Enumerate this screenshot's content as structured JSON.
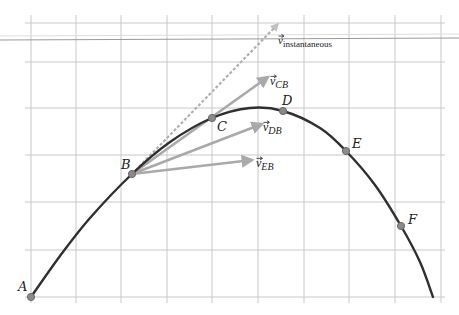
{
  "diagram": {
    "type": "projectile trajectory with average velocity vectors",
    "colors": {
      "grid": "#c8c8c8",
      "grid_strong": "#9a9a9a",
      "curve": "#2f2f2f",
      "vector": "#a9a9a9",
      "dashed_vector": "#b0b0b0",
      "point_fill": "#8a8a8a",
      "point_stroke": "#6a6a6a",
      "text": "#222222"
    },
    "grid": {
      "vertical_x": [
        31,
        76,
        121,
        167,
        212,
        258,
        304,
        349,
        395,
        441
      ],
      "horizontal_y": [
        23,
        62,
        108,
        155,
        202,
        250,
        297
      ],
      "strong_line_y": 40
    },
    "curve_points": [
      [
        31,
        297
      ],
      [
        60,
        256
      ],
      [
        90,
        218
      ],
      [
        132,
        174
      ],
      [
        170,
        142
      ],
      [
        212,
        118
      ],
      [
        250,
        108
      ],
      [
        283,
        111
      ],
      [
        320,
        128
      ],
      [
        346,
        151
      ],
      [
        375,
        185
      ],
      [
        401,
        226
      ],
      [
        420,
        262
      ],
      [
        433,
        297
      ]
    ],
    "points": [
      {
        "label": "A",
        "x": 31,
        "y": 297,
        "label_x": 18,
        "label_y": 291
      },
      {
        "label": "B",
        "x": 132,
        "y": 174,
        "label_x": 121,
        "label_y": 169
      },
      {
        "label": "C",
        "x": 212,
        "y": 118,
        "label_x": 217,
        "label_y": 131
      },
      {
        "label": "D",
        "x": 283,
        "y": 111,
        "label_x": 282,
        "label_y": 105
      },
      {
        "label": "E",
        "x": 346,
        "y": 151,
        "label_x": 352,
        "label_y": 148
      },
      {
        "label": "F",
        "x": 401,
        "y": 226,
        "label_x": 408,
        "label_y": 224
      }
    ],
    "vectors": [
      {
        "name": "v_CB",
        "base": "v",
        "subscript": "CB",
        "from": [
          132,
          174
        ],
        "to": [
          268,
          77
        ],
        "label_x": 270,
        "label_y": 85
      },
      {
        "name": "v_DB",
        "base": "v",
        "subscript": "DB",
        "from": [
          132,
          174
        ],
        "to": [
          262,
          124
        ],
        "label_x": 263,
        "label_y": 131
      },
      {
        "name": "v_EB",
        "base": "v",
        "subscript": "EB",
        "from": [
          132,
          174
        ],
        "to": [
          252,
          160
        ],
        "label_x": 256,
        "label_y": 167
      }
    ],
    "instantaneous_vector": {
      "base": "v",
      "subscript": "instantaneous",
      "from": [
        132,
        174
      ],
      "to": [
        278,
        24
      ],
      "label_x": 278,
      "label_y": 44
    }
  }
}
